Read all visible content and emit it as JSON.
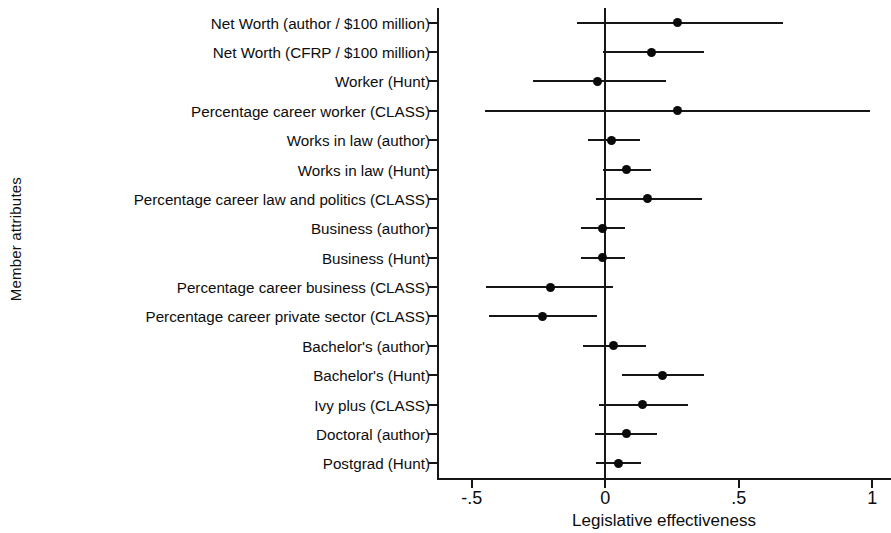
{
  "chart_data": {
    "type": "scatter",
    "subtype": "coefficient-plot-with-confidence-intervals",
    "title": "",
    "xlabel": "Legislative effectiveness",
    "ylabel": "Member attributes",
    "xlim": [
      -0.63,
      1.07
    ],
    "xticks": [
      -0.5,
      0,
      0.5,
      1
    ],
    "xticklabels": [
      "-.5",
      "0",
      ".5",
      "1"
    ],
    "grid": false,
    "legend": null,
    "reference_line": 0,
    "categories": [
      "Net Worth (author / $100 million)",
      "Net Worth (CFRP / $100 million)",
      "Worker (Hunt)",
      "Percentage career worker (CLASS)",
      "Works in law (author)",
      "Works in law (Hunt)",
      "Percentage career law and politics (CLASS)",
      "Business (author)",
      "Business (Hunt)",
      "Percentage career business (CLASS)",
      "Percentage career private sector (CLASS)",
      "Bachelor's (author)",
      "Bachelor's (Hunt)",
      "Ivy plus (CLASS)",
      "Doctoral (author)",
      "Postgrad (Hunt)"
    ],
    "estimates": [
      0.27,
      0.175,
      -0.03,
      0.27,
      0.025,
      0.08,
      0.157,
      -0.01,
      -0.01,
      -0.205,
      -0.235,
      0.03,
      0.216,
      0.14,
      0.08,
      0.05
    ],
    "ci_low": [
      -0.105,
      -0.008,
      -0.27,
      -0.45,
      -0.065,
      -0.01,
      -0.033,
      -0.09,
      -0.09,
      -0.445,
      -0.437,
      -0.085,
      0.063,
      -0.022,
      -0.037,
      -0.033
    ],
    "ci_high": [
      0.665,
      0.37,
      0.228,
      0.99,
      0.13,
      0.172,
      0.362,
      0.075,
      0.075,
      0.03,
      -0.03,
      0.153,
      0.37,
      0.31,
      0.194,
      0.134
    ]
  }
}
